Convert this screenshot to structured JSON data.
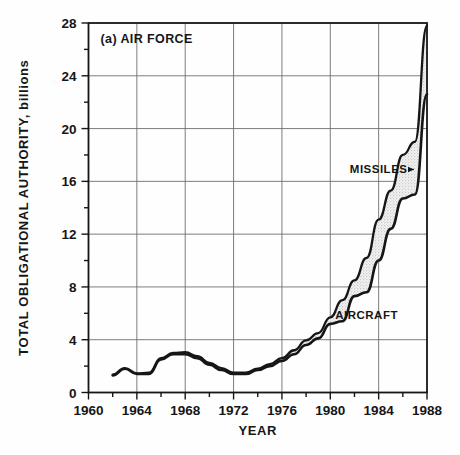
{
  "figure": {
    "panel_label": "(a) AIR FORCE",
    "background_color": "#fefefe",
    "ink_color": "#161616",
    "grid_color": "#6e6e6e",
    "band_fill_color": "#e2e2e2"
  },
  "chart_data": {
    "type": "area",
    "title": "(a) AIR FORCE",
    "subtitle": "",
    "xlabel": "YEAR",
    "ylabel": "TOTAL OBLIGATIONAL AUTHORITY, billions",
    "xlim": [
      1960,
      1988
    ],
    "ylim": [
      0,
      28
    ],
    "grid": true,
    "legend_position": "inline-annotation",
    "x_major_ticks": [
      1960,
      1964,
      1968,
      1972,
      1976,
      1980,
      1984,
      1988
    ],
    "x_minor_ticks": [
      1962,
      1966,
      1970,
      1974,
      1978,
      1982,
      1986
    ],
    "y_major_ticks": [
      0,
      4,
      8,
      12,
      16,
      20,
      24,
      28
    ],
    "y_minor_ticks": [
      2,
      6,
      10,
      14,
      18,
      22,
      26
    ],
    "x_tick_labels": [
      "1960",
      "1964",
      "1968",
      "1972",
      "1976",
      "1980",
      "1984",
      "1988"
    ],
    "y_tick_labels": [
      "0",
      "4",
      "8",
      "12",
      "16",
      "20",
      "24",
      "28"
    ],
    "annotations": [
      {
        "text": "MISSILES",
        "x": 1984.0,
        "y": 16.6,
        "leader": true
      },
      {
        "text": "AIRCRAFT",
        "x": 1983.0,
        "y": 5.6,
        "leader": false
      }
    ],
    "x": [
      1962,
      1963,
      1964,
      1965,
      1966,
      1967,
      1968,
      1969,
      1970,
      1971,
      1972,
      1973,
      1974,
      1975,
      1976,
      1977,
      1978,
      1979,
      1980,
      1981,
      1982,
      1983,
      1984,
      1985,
      1986,
      1987,
      1988
    ],
    "series": [
      {
        "name": "AIRCRAFT",
        "values": [
          1.3,
          1.8,
          1.4,
          1.4,
          2.5,
          2.9,
          2.9,
          2.6,
          2.1,
          1.7,
          1.4,
          1.4,
          1.7,
          2.0,
          2.4,
          2.9,
          3.6,
          4.1,
          5.2,
          5.4,
          7.3,
          7.6,
          10.0,
          12.4,
          14.7,
          15.0,
          22.6
        ]
      },
      {
        "name": "MISSILES",
        "values": [
          0.05,
          0.05,
          0.05,
          0.1,
          0.1,
          0.1,
          0.15,
          0.15,
          0.15,
          0.15,
          0.1,
          0.1,
          0.1,
          0.15,
          0.2,
          0.3,
          0.35,
          0.4,
          0.5,
          1.6,
          1.2,
          2.6,
          3.1,
          2.9,
          3.3,
          4.0,
          5.2
        ]
      }
    ],
    "totals": [
      1.35,
      1.85,
      1.45,
      1.5,
      2.6,
      3.0,
      3.05,
      2.75,
      2.25,
      1.85,
      1.5,
      1.5,
      1.8,
      2.15,
      2.6,
      3.2,
      3.95,
      4.5,
      5.7,
      7.0,
      8.5,
      10.2,
      13.1,
      15.3,
      18.0,
      19.0,
      27.8
    ]
  }
}
